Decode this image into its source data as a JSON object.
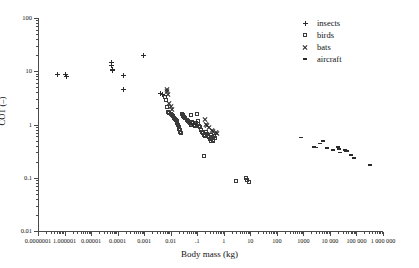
{
  "chart_data": {
    "type": "scatter",
    "title": "",
    "xlabel": "Body mass (kg)",
    "ylabel": "COT (–)",
    "xscale": "log",
    "yscale": "log",
    "xlim": [
      1e-07,
      1000000
    ],
    "ylim": [
      0.01,
      100
    ],
    "grid": false,
    "legend_position": "top-right",
    "xticklabels": [
      "0.0000001",
      "1.000001",
      "0.00001",
      "0.0001",
      "0.001",
      "0.01",
      ".1",
      "1",
      "10",
      "100",
      "1000",
      "10 000",
      "100 000",
      "1 000 000"
    ],
    "xtickvalues": [
      1e-07,
      1e-06,
      1e-05,
      0.0001,
      0.001,
      0.01,
      0.1,
      1,
      10,
      100,
      1000,
      10000,
      100000,
      1000000
    ],
    "yticklabels": [
      "100",
      "10",
      "1",
      "0.1",
      "0.01"
    ],
    "ytickvalues": [
      100,
      10,
      1,
      0.1,
      0.01
    ],
    "series": [
      {
        "name": "insects",
        "marker": "plus",
        "color": "#2b2b2b",
        "points": [
          [
            5.2e-07,
            8.8
          ],
          [
            1.1e-06,
            8.8
          ],
          [
            1.15e-06,
            8.0
          ],
          [
            6e-05,
            14.5
          ],
          [
            6.1e-05,
            12.6
          ],
          [
            6.2e-05,
            11.0
          ],
          [
            6.3e-05,
            10.2
          ],
          [
            0.00016,
            8.4
          ],
          [
            0.00017,
            4.5
          ],
          [
            0.00095,
            20.0
          ],
          [
            0.0043,
            3.8
          ],
          [
            0.005,
            3.7
          ],
          [
            0.01,
            1.55
          ]
        ]
      },
      {
        "name": "birds",
        "marker": "square",
        "color": "#3a3a3a",
        "points": [
          [
            0.0062,
            3.3
          ],
          [
            0.0064,
            2.9
          ],
          [
            0.007,
            2.1
          ],
          [
            0.0076,
            1.75
          ],
          [
            0.009,
            1.62
          ],
          [
            0.0102,
            1.58
          ],
          [
            0.0115,
            1.5
          ],
          [
            0.0125,
            1.42
          ],
          [
            0.0135,
            1.35
          ],
          [
            0.015,
            1.28
          ],
          [
            0.016,
            1.22
          ],
          [
            0.017,
            1.15
          ],
          [
            0.018,
            1.05
          ],
          [
            0.019,
            0.98
          ],
          [
            0.02,
            0.9
          ],
          [
            0.021,
            0.84
          ],
          [
            0.022,
            0.78
          ],
          [
            0.023,
            0.73
          ],
          [
            0.024,
            0.7
          ],
          [
            0.026,
            1.6
          ],
          [
            0.028,
            1.5
          ],
          [
            0.03,
            1.45
          ],
          [
            0.032,
            1.38
          ],
          [
            0.036,
            1.3
          ],
          [
            0.04,
            1.22
          ],
          [
            0.044,
            1.15
          ],
          [
            0.048,
            1.1
          ],
          [
            0.052,
            1.05
          ],
          [
            0.056,
            1.0
          ],
          [
            0.06,
            1.48
          ],
          [
            0.066,
            1.12
          ],
          [
            0.072,
            1.05
          ],
          [
            0.078,
            0.98
          ],
          [
            0.084,
            0.92
          ],
          [
            0.09,
            1.05
          ],
          [
            0.1,
            1.55
          ],
          [
            0.105,
            1.18
          ],
          [
            0.11,
            1.02
          ],
          [
            0.12,
            0.95
          ],
          [
            0.13,
            0.88
          ],
          [
            0.14,
            0.78
          ],
          [
            0.15,
            0.72
          ],
          [
            0.16,
            0.68
          ],
          [
            0.18,
            0.64
          ],
          [
            0.2,
            0.6
          ],
          [
            0.22,
            0.72
          ],
          [
            0.24,
            0.66
          ],
          [
            0.26,
            0.62
          ],
          [
            0.28,
            0.58
          ],
          [
            0.3,
            0.54
          ],
          [
            0.32,
            0.5
          ],
          [
            0.34,
            0.64
          ],
          [
            0.36,
            0.58
          ],
          [
            0.38,
            0.52
          ],
          [
            0.4,
            0.48
          ],
          [
            0.44,
            0.62
          ],
          [
            0.48,
            0.56
          ],
          [
            0.18,
            0.26
          ],
          [
            3.0,
            0.088
          ],
          [
            7.0,
            0.098
          ],
          [
            7.8,
            0.092
          ],
          [
            8.6,
            0.082
          ]
        ]
      },
      {
        "name": "bats",
        "marker": "cross",
        "color": "#2b2b2b",
        "points": [
          [
            0.007,
            4.6
          ],
          [
            0.0074,
            4.1
          ],
          [
            0.008,
            3.6
          ],
          [
            0.009,
            2.5
          ],
          [
            0.01,
            2.2
          ],
          [
            0.011,
            1.95
          ],
          [
            0.065,
            1.02
          ],
          [
            0.08,
            1.05
          ],
          [
            0.2,
            1.22
          ],
          [
            0.21,
            1.0
          ],
          [
            0.24,
            0.95
          ],
          [
            0.28,
            0.88
          ],
          [
            0.36,
            0.78
          ],
          [
            0.4,
            0.74
          ],
          [
            0.5,
            0.72
          ],
          [
            0.58,
            0.68
          ]
        ]
      },
      {
        "name": "aircraft",
        "marker": "dash",
        "color": "#2b2b2b",
        "points": [
          [
            820,
            0.57
          ],
          [
            2600,
            0.38
          ],
          [
            3000,
            0.37
          ],
          [
            4200,
            0.44
          ],
          [
            5400,
            0.49
          ],
          [
            8000,
            0.36
          ],
          [
            13000,
            0.33
          ],
          [
            20000,
            0.39
          ],
          [
            21000,
            0.37
          ],
          [
            22000,
            0.35
          ],
          [
            24000,
            0.3
          ],
          [
            38000,
            0.33
          ],
          [
            42000,
            0.31
          ],
          [
            45000,
            0.32
          ],
          [
            62000,
            0.27
          ],
          [
            78000,
            0.24
          ],
          [
            80000,
            0.235
          ],
          [
            310000,
            0.175
          ]
        ]
      }
    ]
  },
  "legend": {
    "entries": [
      {
        "label": "insects",
        "marker": "plus"
      },
      {
        "label": "birds",
        "marker": "square"
      },
      {
        "label": "bats",
        "marker": "cross"
      },
      {
        "label": "aircraft",
        "marker": "dash"
      }
    ]
  }
}
